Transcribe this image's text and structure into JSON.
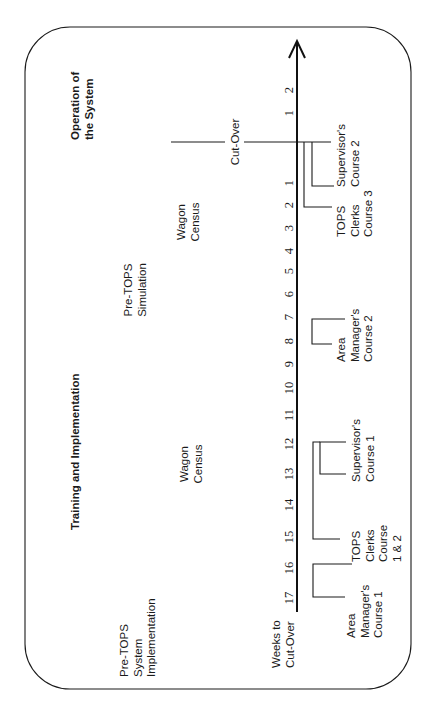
{
  "diagram": {
    "orientation": "rotated-90-ccw",
    "phases": {
      "operation": [
        "Operation of",
        "the System"
      ],
      "training": "Training and Implementation",
      "pre_tops": [
        "Pre-TOPS",
        "System",
        "Implementation"
      ]
    },
    "activities": {
      "wagon_census_1": [
        "Wagon",
        "Census"
      ],
      "wagon_census_2": [
        "Wagon",
        "Census"
      ],
      "pre_tops_simulation": [
        "Pre-TOPS",
        "Simulation"
      ]
    },
    "cut_over_label": "Cut-Over",
    "axis_title": [
      "Weeks to",
      "Cut-Over"
    ],
    "weeks_before": [
      "1",
      "2",
      "3",
      "4",
      "5",
      "6",
      "7",
      "8",
      "9",
      "10",
      "11",
      "12",
      "13",
      "14",
      "15",
      "16",
      "17"
    ],
    "weeks_after": [
      "1",
      "2"
    ],
    "courses": {
      "supervisors_2": [
        "Supervisor's",
        "Course 2"
      ],
      "tops_clerks_3": [
        "TOPS",
        "Clerks",
        "Course 3"
      ],
      "area_managers_2": [
        "Area",
        "Manager's",
        "Course 2"
      ],
      "supervisors_1": [
        "Supervisor's",
        "Course 1"
      ],
      "tops_clerks_1_2": [
        "TOPS",
        "Clerks",
        "Course",
        "1 & 2"
      ],
      "area_managers_1": [
        "Area",
        "Manager's",
        "Course 1"
      ]
    },
    "colors": {
      "ink": "#1a1a1a",
      "background": "#ffffff"
    }
  }
}
